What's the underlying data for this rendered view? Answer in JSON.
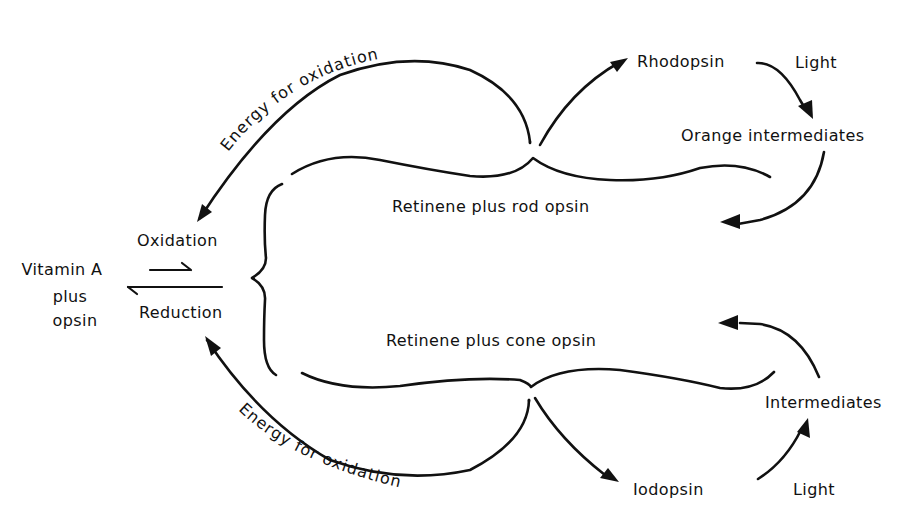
{
  "diagram": {
    "left": {
      "vitamin_a_line1": "Vitamin A",
      "vitamin_a_line2": "plus",
      "vitamin_a_line3": "opsin",
      "oxidation": "Oxidation",
      "reduction": "Reduction"
    },
    "center": {
      "rod_complex": "Retinene plus rod opsin",
      "cone_complex": "Retinene plus cone opsin"
    },
    "arcs": {
      "top_energy": "Energy for oxidation",
      "bottom_energy": "Energy for oxidation"
    },
    "rod_cycle": {
      "pigment": "Rhodopsin",
      "light": "Light",
      "intermediates": "Orange intermediates"
    },
    "cone_cycle": {
      "pigment": "Iodopsin",
      "light": "Light",
      "intermediates": "Intermediates"
    },
    "colors": {
      "ink": "#111111",
      "background": "#ffffff"
    }
  }
}
